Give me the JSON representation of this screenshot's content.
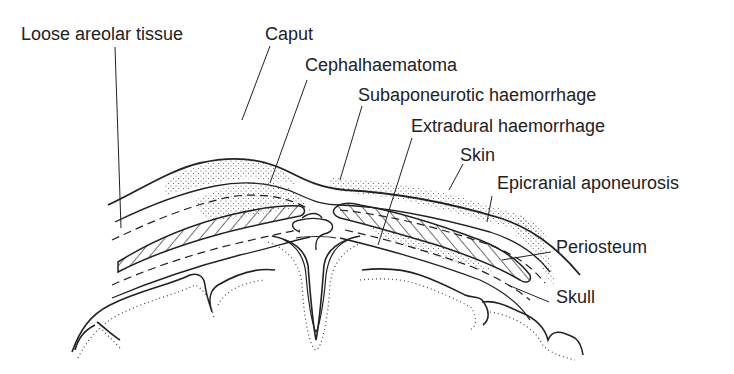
{
  "figure": {
    "type": "anatomical cross-section"
  },
  "labels": [
    {
      "id": "loose-areolar-tissue",
      "text": "Loose areolar tissue"
    },
    {
      "id": "caput",
      "text": "Caput"
    },
    {
      "id": "cephalhaematoma",
      "text": "Cephalhaematoma"
    },
    {
      "id": "subaponeurotic-haemorrhage",
      "text": "Subaponeurotic haemorrhage"
    },
    {
      "id": "extradural-haemorrhage",
      "text": "Extradural haemorrhage"
    },
    {
      "id": "skin",
      "text": "Skin"
    },
    {
      "id": "epicranial-aponeurosis",
      "text": "Epicranial aponeurosis"
    },
    {
      "id": "periosteum",
      "text": "Periosteum"
    },
    {
      "id": "skull",
      "text": "Skull"
    }
  ],
  "colors": {
    "line": "#222222",
    "background": "#ffffff"
  }
}
